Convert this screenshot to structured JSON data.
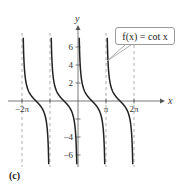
{
  "chart_data": {
    "type": "line",
    "title": "",
    "function_label": "f(x) = cot x",
    "xlabel": "x",
    "ylabel": "y",
    "xlim": [
      -6.9,
      7.5
    ],
    "ylim": [
      -7.2,
      7.2
    ],
    "x_ticks": [
      {
        "value": -6.2832,
        "label": "−2π"
      },
      {
        "value": -3.1416,
        "label": ""
      },
      {
        "value": 3.1416,
        "label": "π"
      },
      {
        "value": 6.2832,
        "label": "2π"
      }
    ],
    "y_ticks": [
      {
        "value": 6,
        "label": "6"
      },
      {
        "value": 4,
        "label": "4"
      },
      {
        "value": 2,
        "label": "2"
      },
      {
        "value": -2,
        "label": ""
      },
      {
        "value": -4,
        "label": "−4"
      },
      {
        "value": -6,
        "label": "−6"
      }
    ],
    "asymptotes_x": [
      -6.2832,
      -3.1416,
      0,
      3.1416,
      6.2832
    ],
    "grid": false,
    "series": [
      {
        "name": "cot x, (-2π,-π)",
        "x_range": [
          -6.2832,
          -3.1416
        ]
      },
      {
        "name": "cot x, (-π,0)",
        "x_range": [
          -3.1416,
          0
        ]
      },
      {
        "name": "cot x, (0,π)",
        "x_range": [
          0,
          3.1416
        ]
      },
      {
        "name": "cot x, (π,2π)",
        "x_range": [
          3.1416,
          6.2832
        ]
      }
    ],
    "panel_label": "(c)"
  },
  "callout": {
    "text": "f(x) = cot x"
  },
  "panel": {
    "label": "(c)"
  }
}
